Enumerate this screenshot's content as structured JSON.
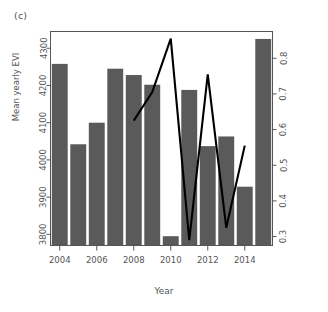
{
  "figure": {
    "panel_label": "(c)",
    "xlabel": "Year",
    "ylabel_left": "Mean yearly EVI",
    "ylabel_right": "Proportion of infants to survive to one year",
    "bar_color": "#5a5a5a",
    "line_color": "#000000",
    "axis_color": "#555555",
    "background": "#ffffff"
  },
  "chart_data": {
    "type": "bar",
    "title": "(c)",
    "xlabel": "Year",
    "ylabel": "Mean yearly EVI",
    "y2label": "Proportion of infants to survive to one year",
    "grid": false,
    "legend": "none",
    "categories": [
      2004,
      2005,
      2006,
      2007,
      2008,
      2009,
      2010,
      2011,
      2012,
      2013,
      2014,
      2015
    ],
    "x_tick_labels": [
      "2004",
      "2006",
      "2008",
      "2010",
      "2012",
      "2014"
    ],
    "x_tick_values": [
      2004,
      2006,
      2008,
      2010,
      2012,
      2014
    ],
    "series": [
      {
        "name": "Mean yearly EVI",
        "type": "bar",
        "axis": "left",
        "values": [
          4258,
          4042,
          4100,
          4245,
          4228,
          4202,
          3795,
          4188,
          4037,
          4063,
          3928,
          4325
        ]
      },
      {
        "name": "Proportion of infants to survive to one year",
        "type": "line",
        "axis": "right",
        "x": [
          2008,
          2009,
          2010,
          2011,
          2012,
          2013,
          2014
        ],
        "values": [
          0.625,
          0.705,
          0.855,
          0.29,
          0.755,
          0.325,
          0.555
        ]
      }
    ],
    "ylim": [
      3770,
      4345
    ],
    "y_tick_labels": [
      "3800",
      "3900",
      "4000",
      "4100",
      "4200",
      "4300"
    ],
    "y_tick_values": [
      3800,
      3900,
      4000,
      4100,
      4200,
      4300
    ],
    "y2lim": [
      0.275,
      0.875
    ],
    "y2_tick_labels": [
      "0.3",
      "0.4",
      "0.5",
      "0.6",
      "0.7",
      "0.8"
    ],
    "y2_tick_values": [
      0.3,
      0.4,
      0.5,
      0.6,
      0.7,
      0.8
    ]
  }
}
